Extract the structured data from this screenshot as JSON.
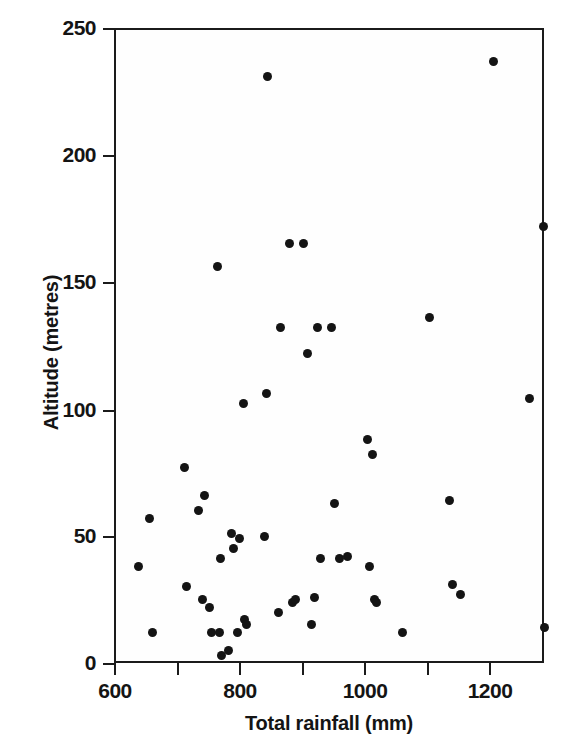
{
  "chart_data": {
    "type": "scatter",
    "title": "",
    "subtitle": "",
    "xlabel": "Total rainfall (mm)",
    "ylabel": "Altitude (metres)",
    "xlim": [
      600,
      1286
    ],
    "ylim": [
      0,
      250
    ],
    "xticks": [
      600,
      700,
      800,
      900,
      1000,
      1100,
      1200
    ],
    "xtick_labels": [
      "600",
      "",
      "800",
      "",
      "1000",
      "",
      "1200"
    ],
    "yticks": [
      0,
      50,
      100,
      150,
      200,
      250
    ],
    "ytick_labels": [
      "0",
      "50",
      "100",
      "150",
      "200",
      "250"
    ],
    "grid": false,
    "legend": null,
    "marker": "filled-circle",
    "marker_color": "#141414",
    "frame_color": "#1b1b1b",
    "background_color": "#ffffff",
    "n_points": 53,
    "series": [
      {
        "name": "rainfall-altitude",
        "points": [
          [
            639,
            38
          ],
          [
            656,
            57
          ],
          [
            661,
            12
          ],
          [
            712,
            77
          ],
          [
            716,
            30
          ],
          [
            735,
            60
          ],
          [
            741,
            25
          ],
          [
            745,
            66
          ],
          [
            752,
            22
          ],
          [
            756,
            12
          ],
          [
            765,
            156
          ],
          [
            769,
            12
          ],
          [
            770,
            41
          ],
          [
            772,
            3
          ],
          [
            782,
            5
          ],
          [
            788,
            51
          ],
          [
            790,
            45
          ],
          [
            797,
            12
          ],
          [
            800,
            49
          ],
          [
            806,
            102
          ],
          [
            808,
            17
          ],
          [
            812,
            15
          ],
          [
            840,
            50
          ],
          [
            843,
            106
          ],
          [
            845,
            231
          ],
          [
            862,
            20
          ],
          [
            865,
            132
          ],
          [
            880,
            165
          ],
          [
            885,
            24
          ],
          [
            889,
            25
          ],
          [
            902,
            165
          ],
          [
            909,
            122
          ],
          [
            915,
            15
          ],
          [
            920,
            26
          ],
          [
            925,
            132
          ],
          [
            930,
            41
          ],
          [
            947,
            132
          ],
          [
            952,
            63
          ],
          [
            960,
            41
          ],
          [
            972,
            42
          ],
          [
            1004,
            88
          ],
          [
            1008,
            38
          ],
          [
            1012,
            82
          ],
          [
            1016,
            25
          ],
          [
            1018,
            24
          ],
          [
            1060,
            12
          ],
          [
            1103,
            136
          ],
          [
            1135,
            64
          ],
          [
            1140,
            31
          ],
          [
            1152,
            27
          ],
          [
            1205,
            237
          ],
          [
            1263,
            104
          ],
          [
            1285,
            172
          ],
          [
            1286,
            14
          ]
        ]
      }
    ]
  },
  "axes": {
    "x": {
      "title": "Total rainfall (mm)",
      "ticks": [
        {
          "value": 600,
          "label": "600",
          "px": 114
        },
        {
          "value": 700,
          "label": "",
          "px": 177
        },
        {
          "value": 800,
          "label": "800",
          "px": 239
        },
        {
          "value": 900,
          "label": "",
          "px": 302
        },
        {
          "value": 1000,
          "label": "1000",
          "px": 364
        },
        {
          "value": 1100,
          "label": "",
          "px": 427
        },
        {
          "value": 1200,
          "label": "1200",
          "px": 489
        }
      ]
    },
    "y": {
      "title": "Altitude (metres)",
      "ticks": [
        {
          "value": 250,
          "label": "250",
          "px": 28
        },
        {
          "value": 200,
          "label": "200",
          "px": 155
        },
        {
          "value": 150,
          "label": "150",
          "px": 282
        },
        {
          "value": 100,
          "label": "100",
          "px": 410
        },
        {
          "value": 50,
          "label": "50",
          "px": 536
        },
        {
          "value": 0,
          "label": "0",
          "px": 663
        }
      ]
    }
  }
}
